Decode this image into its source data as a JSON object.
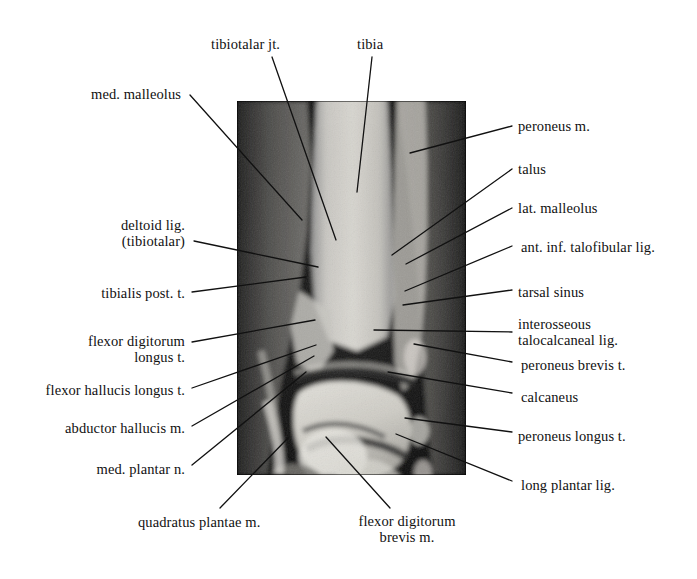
{
  "figure": {
    "kind": "annotated-mri",
    "frame": {
      "x": 237,
      "y": 101,
      "width": 229,
      "height": 374
    },
    "background_color": "#0a0a0a",
    "page_background": "#ffffff",
    "text_color": "#111111"
  },
  "labels": [
    {
      "id": "tibiotalar-jt",
      "text": "tibiotalar jt.",
      "align": "left",
      "box": {
        "left": 211,
        "top": 36,
        "width": 92
      },
      "leader": {
        "x1": 272,
        "y1": 57,
        "x2": 336,
        "y2": 240
      }
    },
    {
      "id": "tibia",
      "text": "tibia",
      "align": "left",
      "box": {
        "left": 357,
        "top": 36,
        "width": 46
      },
      "leader": {
        "x1": 372,
        "y1": 57,
        "x2": 357,
        "y2": 192
      }
    },
    {
      "id": "med-malleolus",
      "text": "med. malleolus",
      "align": "right",
      "box": {
        "left": 33,
        "top": 86,
        "width": 148
      },
      "leader": {
        "x1": 190,
        "y1": 95,
        "x2": 302,
        "y2": 220
      }
    },
    {
      "id": "deltoid-lig-tibiotalar",
      "text": "deltoid lig.\n(tibiotalar)",
      "align": "right",
      "box": {
        "left": 37,
        "top": 217,
        "width": 148
      },
      "leader": {
        "x1": 194,
        "y1": 241,
        "x2": 318,
        "y2": 267
      }
    },
    {
      "id": "tibialis-post-t",
      "text": "tibialis post. t.",
      "align": "right",
      "box": {
        "left": 40,
        "top": 285,
        "width": 145
      },
      "leader": {
        "x1": 192,
        "y1": 292,
        "x2": 306,
        "y2": 277
      }
    },
    {
      "id": "flexor-digitorum-longus-t",
      "text": "flexor digitorum\nlongus t.",
      "align": "right",
      "box": {
        "left": 37,
        "top": 333,
        "width": 148
      },
      "leader": {
        "x1": 192,
        "y1": 342,
        "x2": 315,
        "y2": 320
      }
    },
    {
      "id": "flexor-hallucis-longus-t",
      "text": "flexor hallucis longus t.",
      "align": "right",
      "box": {
        "left": 25,
        "top": 382,
        "width": 160
      },
      "leader": {
        "x1": 192,
        "y1": 388,
        "x2": 316,
        "y2": 345
      }
    },
    {
      "id": "abductor-hallucis-m",
      "text": "abductor hallucis m.",
      "align": "right",
      "box": {
        "left": 40,
        "top": 420,
        "width": 145
      },
      "leader": {
        "x1": 192,
        "y1": 426,
        "x2": 314,
        "y2": 356
      }
    },
    {
      "id": "med-plantar-n",
      "text": "med. plantar n.",
      "align": "right",
      "box": {
        "left": 45,
        "top": 461,
        "width": 140
      },
      "leader": {
        "x1": 192,
        "y1": 465,
        "x2": 306,
        "y2": 372
      }
    },
    {
      "id": "quadratus-plantae-m",
      "text": "quadratus plantae m.",
      "align": "left",
      "box": {
        "left": 138,
        "top": 514,
        "width": 175
      },
      "leader": {
        "x1": 220,
        "y1": 508,
        "x2": 288,
        "y2": 438
      }
    },
    {
      "id": "flexor-digitorum-brevis-m",
      "text": "flexor digitorum\nbrevis m.",
      "align": "center",
      "box": {
        "left": 341,
        "top": 513,
        "width": 132
      },
      "leader": {
        "x1": 390,
        "y1": 508,
        "x2": 326,
        "y2": 437
      }
    },
    {
      "id": "peroneus-m",
      "text": "peroneus m.",
      "align": "left",
      "box": {
        "left": 518,
        "top": 118,
        "width": 128
      },
      "leader": {
        "x1": 512,
        "y1": 126,
        "x2": 410,
        "y2": 153
      }
    },
    {
      "id": "talus",
      "text": "talus",
      "align": "left",
      "box": {
        "left": 518,
        "top": 161,
        "width": 128
      },
      "leader": {
        "x1": 512,
        "y1": 169,
        "x2": 392,
        "y2": 255
      }
    },
    {
      "id": "lat-malleolus",
      "text": "lat. malleolus",
      "align": "left",
      "box": {
        "left": 518,
        "top": 200,
        "width": 128
      },
      "leader": {
        "x1": 512,
        "y1": 208,
        "x2": 406,
        "y2": 264
      }
    },
    {
      "id": "ant-inf-talofibular-lig",
      "text": "ant. inf. talofibular lig.",
      "align": "left",
      "box": {
        "left": 521,
        "top": 239,
        "width": 170
      },
      "leader": {
        "x1": 512,
        "y1": 246,
        "x2": 405,
        "y2": 291
      }
    },
    {
      "id": "tarsal-sinus",
      "text": "tarsal sinus",
      "align": "left",
      "box": {
        "left": 518,
        "top": 284,
        "width": 128
      },
      "leader": {
        "x1": 512,
        "y1": 290,
        "x2": 403,
        "y2": 305
      }
    },
    {
      "id": "interosseous-talocalcaneal-lig",
      "text": "interosseous\ntalocalcaneal lig.",
      "align": "left",
      "box": {
        "left": 518,
        "top": 316,
        "width": 160
      },
      "leader": {
        "x1": 512,
        "y1": 332,
        "x2": 374,
        "y2": 330
      }
    },
    {
      "id": "peroneus-brevis-t",
      "text": "peroneus brevis t.",
      "align": "left",
      "box": {
        "left": 521,
        "top": 357,
        "width": 150
      },
      "leader": {
        "x1": 512,
        "y1": 362,
        "x2": 414,
        "y2": 344
      }
    },
    {
      "id": "calcaneus",
      "text": "calcaneus",
      "align": "left",
      "box": {
        "left": 521,
        "top": 389,
        "width": 128
      },
      "leader": {
        "x1": 512,
        "y1": 393,
        "x2": 388,
        "y2": 372
      }
    },
    {
      "id": "peroneus-longus-t",
      "text": "peroneus longus t.",
      "align": "left",
      "box": {
        "left": 518,
        "top": 428,
        "width": 150
      },
      "leader": {
        "x1": 512,
        "y1": 432,
        "x2": 405,
        "y2": 418
      }
    },
    {
      "id": "long-plantar-lig",
      "text": "long plantar lig.",
      "align": "left",
      "box": {
        "left": 521,
        "top": 477,
        "width": 140
      },
      "leader": {
        "x1": 512,
        "y1": 481,
        "x2": 396,
        "y2": 434
      }
    }
  ]
}
